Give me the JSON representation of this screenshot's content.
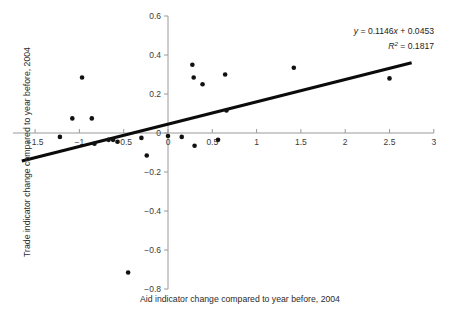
{
  "chart_data": {
    "type": "scatter",
    "title": "",
    "xlabel": "Aid indicator change compared to year before, 2004",
    "ylabel": "Trade indicator change compared to year before, 2004",
    "xlim": [
      -1.75,
      3.0
    ],
    "ylim": [
      -0.8,
      0.6
    ],
    "grid": false,
    "legend": null,
    "xticks": [
      -1.5,
      -1,
      -0.5,
      0,
      0.5,
      1,
      1.5,
      2,
      2.5,
      3
    ],
    "xtick_labels": [
      "-1.5",
      "-1",
      "-0.5",
      "0",
      "0.5",
      "1",
      "1.5",
      "2",
      "2.5",
      "3"
    ],
    "yticks": [
      -0.8,
      -0.6,
      -0.4,
      -0.2,
      0,
      0.2,
      0.4,
      0.6
    ],
    "ytick_labels": [
      "-0.8",
      "-0.6",
      "-0.4",
      "-0.2",
      "0",
      "0.2",
      "0.4",
      "0.6"
    ],
    "points": [
      {
        "x": -1.22,
        "y": -0.02
      },
      {
        "x": -1.08,
        "y": 0.075
      },
      {
        "x": -0.97,
        "y": 0.285
      },
      {
        "x": -0.86,
        "y": 0.075
      },
      {
        "x": -0.83,
        "y": -0.055
      },
      {
        "x": -0.67,
        "y": -0.035
      },
      {
        "x": -0.62,
        "y": -0.035
      },
      {
        "x": -0.57,
        "y": -0.045
      },
      {
        "x": -0.45,
        "y": -0.715
      },
      {
        "x": -0.3,
        "y": -0.025
      },
      {
        "x": -0.24,
        "y": -0.115
      },
      {
        "x": 0.0,
        "y": -0.015
      },
      {
        "x": 0.155,
        "y": -0.02
      },
      {
        "x": 0.275,
        "y": 0.35
      },
      {
        "x": 0.29,
        "y": 0.285
      },
      {
        "x": 0.3,
        "y": -0.065
      },
      {
        "x": 0.39,
        "y": 0.25
      },
      {
        "x": 0.565,
        "y": -0.035
      },
      {
        "x": 0.645,
        "y": 0.3
      },
      {
        "x": 0.66,
        "y": 0.115
      },
      {
        "x": 1.42,
        "y": 0.335
      },
      {
        "x": 2.5,
        "y": 0.28
      }
    ],
    "trendline": {
      "slope": 0.1146,
      "intercept": 0.0453,
      "x_start": -1.65,
      "x_end": 2.75,
      "r_squared": 0.1817
    },
    "annotations": {
      "equation_y": "y",
      "equation_body": " = 0.1146",
      "equation_x": "x",
      "equation_tail": " + 0.0453",
      "r_symbol": "R",
      "r_exponent": "2",
      "r_value": " = 0.1817"
    }
  },
  "colors": {
    "point": "#111111",
    "trendline": "#0b0b0b",
    "axis": "#9a9a9a",
    "text": "#2b2b2b",
    "background": "#ffffff"
  }
}
